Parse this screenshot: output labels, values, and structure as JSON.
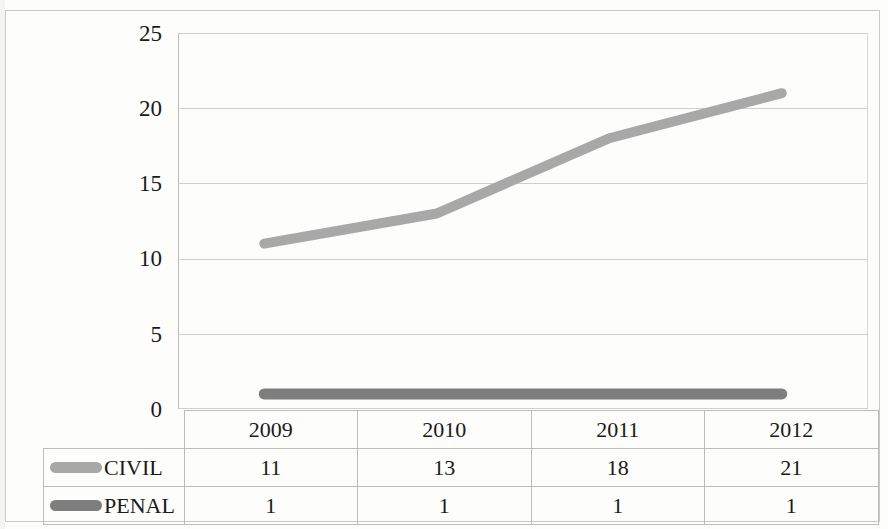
{
  "chart_data": {
    "type": "line",
    "title": "",
    "xlabel": "",
    "ylabel": "",
    "categories": [
      "2009",
      "2010",
      "2011",
      "2012"
    ],
    "series": [
      {
        "name": "CIVIL",
        "values": [
          11,
          13,
          18,
          21
        ],
        "color": "#a8a8a8"
      },
      {
        "name": "PENAL",
        "values": [
          1,
          1,
          1,
          1
        ],
        "color": "#7e7e7e"
      }
    ],
    "ylim": [
      0,
      25
    ],
    "yticks": [
      0,
      5,
      10,
      15,
      20,
      25
    ],
    "grid": true,
    "legend_position": "bottom-table",
    "data_table_visible": true
  },
  "axis": {
    "yticks": [
      "25",
      "20",
      "15",
      "10",
      "5",
      "0"
    ]
  },
  "table": {
    "header": [
      "",
      "2009",
      "2010",
      "2011",
      "2012"
    ],
    "rows": [
      {
        "label": "CIVIL",
        "swatch": "civil-legend-swatch",
        "values": [
          "11",
          "13",
          "18",
          "21"
        ]
      },
      {
        "label": "PENAL",
        "swatch": "penal-legend-swatch",
        "values": [
          "1",
          "1",
          "1",
          "1"
        ]
      }
    ]
  }
}
